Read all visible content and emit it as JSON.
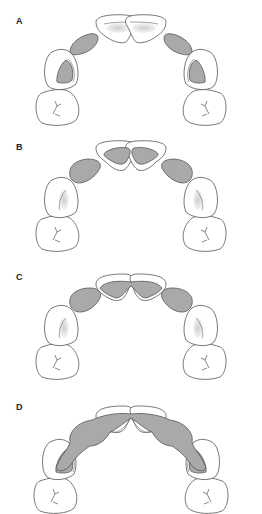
{
  "figure": {
    "colors": {
      "background": "#ffffff",
      "outline": "#555555",
      "fill_grey": "#a9a9a9",
      "label": "#222222"
    },
    "panels": [
      {
        "label": "A",
        "description": "Grey regions on lateral incisors and inside canines; central incisors white with light shading"
      },
      {
        "label": "B",
        "description": "Grey regions on lateral incisors and inside central incisors"
      },
      {
        "label": "C",
        "description": "Grey regions on lateral incisors and central incisors joined at midline"
      },
      {
        "label": "D",
        "description": "Continuous grey region spanning canines, lateral and central incisors"
      }
    ]
  }
}
